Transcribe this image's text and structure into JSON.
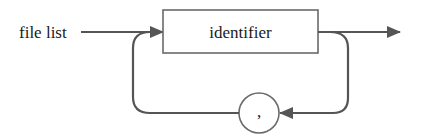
{
  "diagram": {
    "type": "syntax-diagram",
    "rule_name": "file list",
    "nodes": [
      {
        "id": "identifier",
        "kind": "nonterminal",
        "shape": "rectangle",
        "label": "identifier"
      },
      {
        "id": "comma",
        "kind": "terminal",
        "shape": "circle",
        "label": ","
      }
    ],
    "edges": [
      {
        "from": "entry",
        "to": "identifier"
      },
      {
        "from": "identifier",
        "to": "exit"
      },
      {
        "from": "identifier",
        "to": "comma",
        "route": "loop-back-below"
      },
      {
        "from": "comma",
        "to": "identifier"
      }
    ],
    "colors": {
      "line": "#555555",
      "box_stroke": "#6a6a6a",
      "text": "#1a1a1a",
      "background": "#ffffff"
    }
  }
}
